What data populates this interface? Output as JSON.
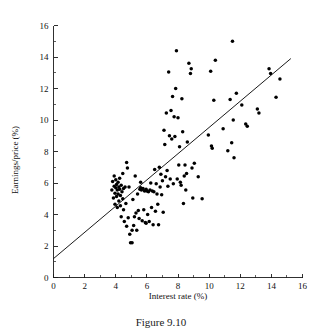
{
  "figure": {
    "caption": "Figure 9.10",
    "background_color": "#ffffff",
    "ink_color": "#000000"
  },
  "chart_data": {
    "type": "scatter",
    "title": "",
    "xlabel": "Interest rate (%)",
    "ylabel": "Earnings/price (%)",
    "xlim": [
      0,
      16
    ],
    "ylim": [
      0,
      16
    ],
    "xticks": [
      0,
      2,
      4,
      6,
      8,
      10,
      12,
      14,
      16
    ],
    "yticks": [
      0,
      2,
      4,
      6,
      8,
      10,
      12,
      14,
      16
    ],
    "xtick_labels": [
      "0",
      "2",
      "4",
      "6",
      "8",
      "10",
      "12",
      "14",
      "16"
    ],
    "ytick_labels": [
      "0",
      "2",
      "4",
      "6",
      "8",
      "10",
      "12",
      "14",
      "16"
    ],
    "minor_tick_step": 1,
    "grid": false,
    "legend": null,
    "marker": "filled-circle",
    "marker_color": "#000000",
    "fit_line": {
      "label": "regression line",
      "color": "#000000",
      "x_start": 0.0,
      "y_start": 1.2,
      "x_end": 15.25,
      "y_end": 13.9,
      "slope": 0.833,
      "intercept": 1.2
    },
    "series": [
      {
        "name": "Countries",
        "points": [
          [
            3.75,
            5.55
          ],
          [
            3.8,
            6.1
          ],
          [
            3.85,
            5.05
          ],
          [
            3.9,
            5.8
          ],
          [
            3.9,
            6.45
          ],
          [
            3.95,
            5.35
          ],
          [
            3.95,
            4.65
          ],
          [
            4.0,
            5.7
          ],
          [
            4.0,
            6.2
          ],
          [
            4.05,
            5.15
          ],
          [
            4.05,
            5.9
          ],
          [
            4.1,
            4.45
          ],
          [
            4.1,
            5.55
          ],
          [
            4.15,
            6.05
          ],
          [
            4.15,
            5.3
          ],
          [
            4.2,
            5.75
          ],
          [
            4.2,
            4.85
          ],
          [
            4.25,
            5.6
          ],
          [
            4.25,
            6.3
          ],
          [
            4.3,
            5.2
          ],
          [
            4.3,
            4.55
          ],
          [
            4.35,
            5.85
          ],
          [
            4.35,
            3.85
          ],
          [
            4.4,
            5.45
          ],
          [
            4.45,
            6.6
          ],
          [
            4.45,
            5.0
          ],
          [
            4.5,
            4.3
          ],
          [
            4.5,
            5.65
          ],
          [
            4.55,
            3.55
          ],
          [
            4.6,
            5.75
          ],
          [
            4.65,
            4.7
          ],
          [
            4.7,
            7.3
          ],
          [
            4.7,
            3.25
          ],
          [
            4.75,
            6.95
          ],
          [
            4.8,
            3.8
          ],
          [
            4.85,
            5.75
          ],
          [
            4.9,
            2.75
          ],
          [
            4.95,
            2.2
          ],
          [
            5.05,
            2.2
          ],
          [
            5.05,
            3.0
          ],
          [
            5.1,
            4.95
          ],
          [
            5.15,
            3.3
          ],
          [
            5.2,
            3.85
          ],
          [
            5.25,
            6.45
          ],
          [
            5.3,
            4.1
          ],
          [
            5.35,
            3.0
          ],
          [
            5.4,
            5.3
          ],
          [
            5.45,
            4.25
          ],
          [
            5.5,
            3.75
          ],
          [
            5.55,
            5.6
          ],
          [
            5.6,
            5.7
          ],
          [
            5.6,
            6.05
          ],
          [
            5.65,
            5.55
          ],
          [
            5.7,
            3.6
          ],
          [
            5.75,
            5.65
          ],
          [
            5.8,
            4.3
          ],
          [
            5.85,
            5.5
          ],
          [
            5.9,
            3.5
          ],
          [
            5.95,
            3.45
          ],
          [
            5.95,
            5.6
          ],
          [
            6.0,
            5.5
          ],
          [
            6.05,
            4.0
          ],
          [
            6.1,
            5.45
          ],
          [
            6.15,
            3.55
          ],
          [
            6.2,
            5.55
          ],
          [
            6.25,
            6.0
          ],
          [
            6.3,
            4.45
          ],
          [
            6.35,
            5.5
          ],
          [
            6.4,
            3.35
          ],
          [
            6.45,
            5.45
          ],
          [
            6.5,
            6.85
          ],
          [
            6.55,
            4.2
          ],
          [
            6.6,
            5.95
          ],
          [
            6.65,
            5.3
          ],
          [
            6.7,
            4.65
          ],
          [
            6.75,
            3.35
          ],
          [
            6.8,
            7.0
          ],
          [
            6.85,
            5.75
          ],
          [
            6.9,
            6.55
          ],
          [
            6.95,
            5.25
          ],
          [
            7.0,
            6.15
          ],
          [
            7.05,
            4.15
          ],
          [
            7.1,
            9.35
          ],
          [
            7.15,
            8.45
          ],
          [
            7.2,
            6.4
          ],
          [
            7.25,
            10.45
          ],
          [
            7.3,
            6.8
          ],
          [
            7.35,
            5.8
          ],
          [
            7.4,
            13.05
          ],
          [
            7.45,
            9.0
          ],
          [
            7.5,
            6.25
          ],
          [
            7.55,
            10.6
          ],
          [
            7.6,
            8.8
          ],
          [
            7.65,
            11.5
          ],
          [
            7.7,
            5.95
          ],
          [
            7.75,
            10.2
          ],
          [
            7.8,
            8.95
          ],
          [
            7.85,
            12.0
          ],
          [
            7.9,
            14.4
          ],
          [
            7.95,
            6.25
          ],
          [
            8.0,
            10.15
          ],
          [
            8.05,
            7.15
          ],
          [
            8.1,
            8.3
          ],
          [
            8.15,
            6.05
          ],
          [
            8.2,
            5.85
          ],
          [
            8.25,
            11.35
          ],
          [
            8.3,
            9.25
          ],
          [
            8.35,
            4.7
          ],
          [
            8.4,
            6.45
          ],
          [
            8.45,
            7.15
          ],
          [
            8.5,
            5.55
          ],
          [
            8.55,
            6.6
          ],
          [
            8.6,
            8.6
          ],
          [
            8.7,
            13.6
          ],
          [
            8.8,
            12.95
          ],
          [
            8.85,
            13.25
          ],
          [
            8.9,
            6.95
          ],
          [
            8.95,
            5.05
          ],
          [
            9.05,
            7.25
          ],
          [
            9.3,
            6.4
          ],
          [
            9.55,
            5.0
          ],
          [
            9.95,
            9.05
          ],
          [
            10.1,
            13.1
          ],
          [
            10.15,
            8.35
          ],
          [
            10.2,
            8.2
          ],
          [
            10.3,
            11.25
          ],
          [
            10.4,
            13.8
          ],
          [
            10.9,
            9.45
          ],
          [
            11.2,
            8.05
          ],
          [
            11.35,
            11.3
          ],
          [
            11.45,
            8.55
          ],
          [
            11.5,
            15.0
          ],
          [
            11.55,
            10.0
          ],
          [
            11.6,
            7.6
          ],
          [
            11.75,
            11.7
          ],
          [
            12.1,
            10.95
          ],
          [
            12.35,
            9.75
          ],
          [
            12.45,
            9.6
          ],
          [
            13.1,
            10.7
          ],
          [
            13.2,
            10.45
          ],
          [
            13.85,
            13.25
          ],
          [
            13.95,
            12.95
          ],
          [
            14.3,
            11.45
          ],
          [
            14.55,
            12.6
          ]
        ]
      }
    ]
  }
}
